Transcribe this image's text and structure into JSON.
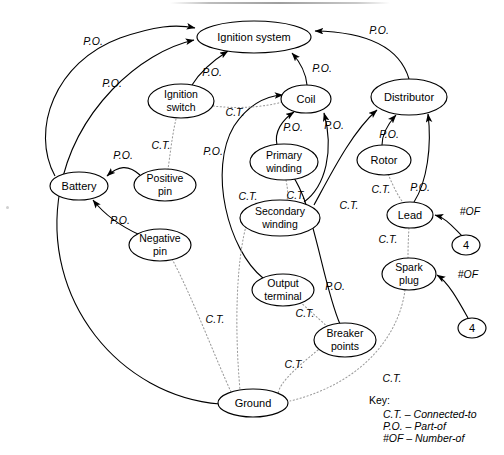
{
  "diagram": {
    "top_rule": true,
    "nodes": [
      {
        "id": "ignition_system",
        "label": "Ignition system",
        "cx": 254,
        "cy": 37,
        "rx": 57,
        "ry": 16
      },
      {
        "id": "ignition_switch",
        "label_line1": "Ignition",
        "label_line2": "switch",
        "cx": 181,
        "cy": 101,
        "rx": 33,
        "ry": 17
      },
      {
        "id": "coil",
        "label": "Coil",
        "cx": 306,
        "cy": 99,
        "rx": 25,
        "ry": 14
      },
      {
        "id": "distributor",
        "label": "Distributor",
        "cx": 409,
        "cy": 97,
        "rx": 38,
        "ry": 18
      },
      {
        "id": "battery",
        "label": "Battery",
        "cx": 79,
        "cy": 186,
        "rx": 29,
        "ry": 14
      },
      {
        "id": "positive_pin",
        "label_line1": "Positive",
        "label_line2": "pin",
        "cx": 165,
        "cy": 185,
        "rx": 31,
        "ry": 16
      },
      {
        "id": "primary_winding",
        "label_line1": "Primary",
        "label_line2": "winding",
        "cx": 284,
        "cy": 162,
        "rx": 34,
        "ry": 18
      },
      {
        "id": "rotor",
        "label": "Rotor",
        "cx": 384,
        "cy": 160,
        "rx": 27,
        "ry": 15
      },
      {
        "id": "negative_pin",
        "label_line1": "Negative",
        "label_line2": "pin",
        "cx": 160,
        "cy": 245,
        "rx": 31,
        "ry": 16
      },
      {
        "id": "secondary_winding",
        "label_line1": "Secondary",
        "label_line2": "winding",
        "cx": 280,
        "cy": 218,
        "rx": 40,
        "ry": 18
      },
      {
        "id": "lead",
        "label": "Lead",
        "cx": 410,
        "cy": 215,
        "rx": 23,
        "ry": 13
      },
      {
        "id": "four_lead",
        "label": "4",
        "cx": 466,
        "cy": 245,
        "rx": 14,
        "ry": 10
      },
      {
        "id": "output_terminal",
        "label_line1": "Output",
        "label_line2": "terminal",
        "cx": 283,
        "cy": 290,
        "rx": 31,
        "ry": 16
      },
      {
        "id": "spark_plug",
        "label_line1": "Spark",
        "label_line2": "plug",
        "cx": 409,
        "cy": 274,
        "rx": 27,
        "ry": 16
      },
      {
        "id": "four_plug",
        "label": "4",
        "cx": 472,
        "cy": 328,
        "rx": 14,
        "ry": 10
      },
      {
        "id": "breaker_points",
        "label_line1": "Breaker",
        "label_line2": "points",
        "cx": 345,
        "cy": 340,
        "rx": 31,
        "ry": 17
      },
      {
        "id": "ground",
        "label": "Ground",
        "cx": 253,
        "cy": 403,
        "rx": 35,
        "ry": 14
      }
    ],
    "edges": [
      {
        "from": "battery",
        "to": "ignition_system",
        "type": "solid",
        "relation": "P.O.",
        "label_x": 93,
        "label_y": 42
      },
      {
        "from": "ground",
        "to": "ignition_system",
        "type": "solid",
        "relation": "P.O.",
        "label_x": 112,
        "label_y": 84
      },
      {
        "from": "ignition_switch",
        "to": "ignition_system",
        "type": "solid",
        "relation": "P.O.",
        "label_x": 212,
        "label_y": 73
      },
      {
        "from": "coil",
        "to": "ignition_system",
        "type": "solid",
        "relation": "P.O.",
        "label_x": 322,
        "label_y": 69
      },
      {
        "from": "distributor",
        "to": "ignition_system",
        "type": "solid",
        "relation": "P.O.",
        "label_x": 379,
        "label_y": 31
      },
      {
        "from": "positive_pin",
        "to": "battery",
        "type": "solid",
        "relation": "P.O.",
        "label_x": 123,
        "label_y": 156
      },
      {
        "from": "negative_pin",
        "to": "battery",
        "type": "solid",
        "relation": "P.O.",
        "label_x": 120,
        "label_y": 221
      },
      {
        "from": "ignition_switch",
        "to": "positive_pin",
        "type": "dotted",
        "relation": "C.T.",
        "label_x": 161,
        "label_y": 146
      },
      {
        "from": "ignition_switch",
        "to": "coil",
        "type": "dotted",
        "relation": "C.T.",
        "label_x": 235,
        "label_y": 113
      },
      {
        "from": "primary_winding",
        "to": "coil",
        "type": "solid",
        "relation": "P.O.",
        "label_x": 293,
        "label_y": 128
      },
      {
        "from": "secondary_winding",
        "to": "coil",
        "type": "solid",
        "relation": "P.O.",
        "label_x": 334,
        "label_y": 126
      },
      {
        "from": "output_terminal",
        "to": "coil",
        "type": "solid",
        "relation": "P.O.",
        "label_x": 213,
        "label_y": 152
      },
      {
        "from": "primary_winding",
        "to": "secondary_winding",
        "type": "dotted",
        "relation": "C.T.",
        "label_x": 296,
        "label_y": 196
      },
      {
        "from": "secondary_winding",
        "to": "ground",
        "type": "dotted",
        "relation": "C.T.",
        "label_x": 248,
        "label_y": 197
      },
      {
        "from": "rotor",
        "to": "distributor",
        "type": "solid",
        "relation": "P.O.",
        "label_x": 389,
        "label_y": 135
      },
      {
        "from": "lead",
        "to": "distributor",
        "type": "solid",
        "relation": "P.O.",
        "label_x": 420,
        "label_y": 188
      },
      {
        "from": "rotor",
        "to": "lead",
        "type": "dotted",
        "relation": "C.T.",
        "label_x": 381,
        "label_y": 190
      },
      {
        "from": "secondary_winding",
        "to": "distributor",
        "type": "solid",
        "relation": "C.T.",
        "label_x": 349,
        "label_y": 206
      },
      {
        "from": "lead",
        "to": "spark_plug",
        "type": "dotted",
        "relation": "C.T.",
        "label_x": 388,
        "label_y": 240
      },
      {
        "from": "four_lead",
        "to": "lead",
        "type": "solid",
        "relation": "#OF",
        "label_x": 470,
        "label_y": 212
      },
      {
        "from": "four_plug",
        "to": "spark_plug",
        "type": "solid",
        "relation": "#OF",
        "label_x": 468,
        "label_y": 275
      },
      {
        "from": "output_terminal",
        "to": "breaker_points",
        "type": "dotted",
        "relation": "C.T.",
        "label_x": 305,
        "label_y": 314
      },
      {
        "from": "breaker_points",
        "to": "primary_winding",
        "type": "solid",
        "relation": "P.O.",
        "label_x": 335,
        "label_y": 287
      },
      {
        "from": "breaker_points",
        "to": "ground",
        "type": "dotted",
        "relation": "C.T.",
        "label_x": 294,
        "label_y": 365
      },
      {
        "from": "negative_pin",
        "to": "ground",
        "type": "dotted",
        "relation": "C.T.",
        "label_x": 215,
        "label_y": 320
      },
      {
        "from": "spark_plug",
        "to": "ground",
        "type": "dotted",
        "relation": "C.T.",
        "label_x": 392,
        "label_y": 379
      }
    ]
  },
  "key": {
    "title": "Key:",
    "rows": [
      {
        "abbr": "C.T.",
        "dash": "–",
        "meaning": "Connected-to"
      },
      {
        "abbr": "P.O.",
        "dash": "–",
        "meaning": "Part-of"
      },
      {
        "abbr": "#OF",
        "dash": "–",
        "meaning": "Number-of"
      }
    ]
  }
}
